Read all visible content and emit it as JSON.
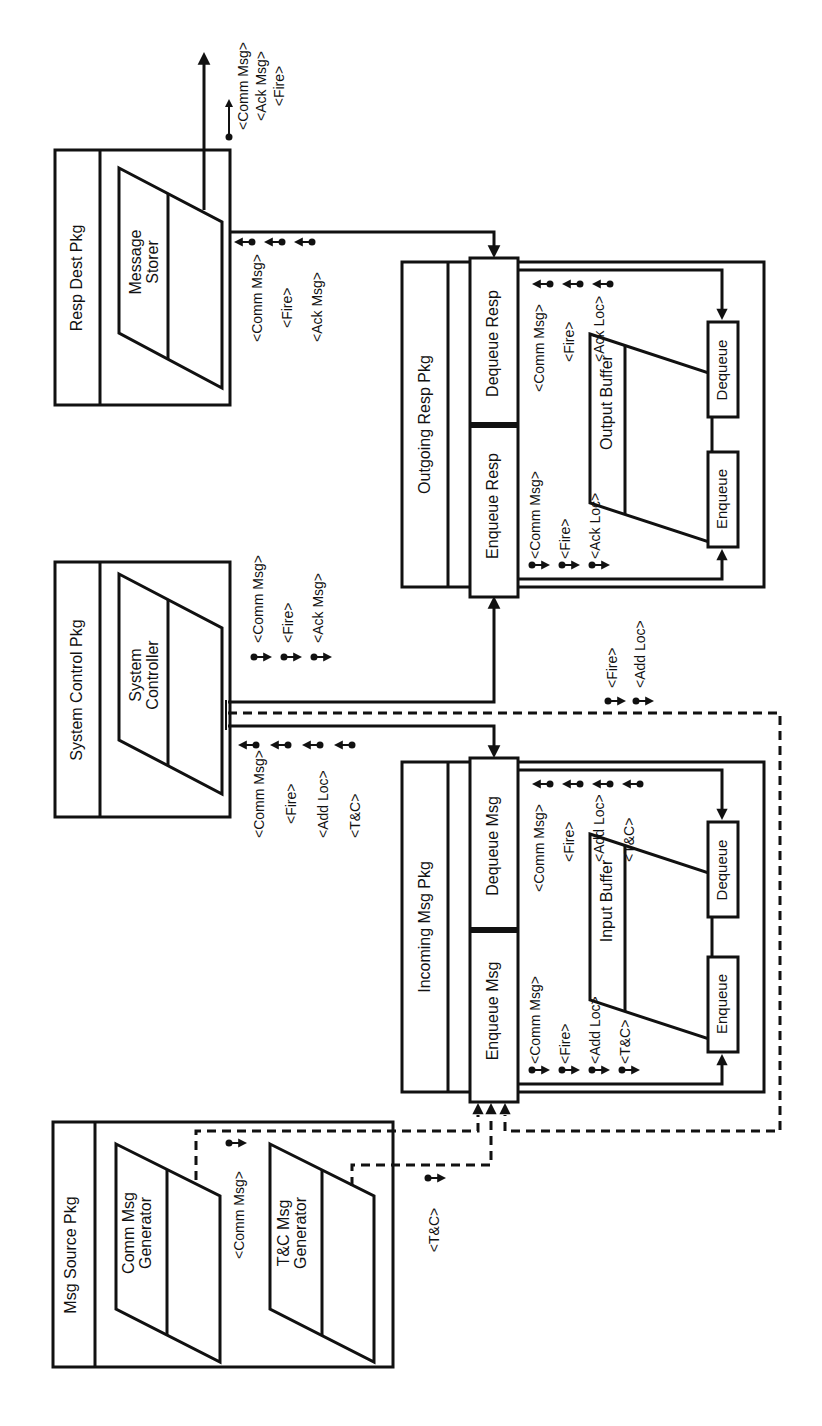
{
  "diagram": {
    "orientation": "rotated-90-ccw",
    "packages": {
      "resp_dest": {
        "title": "Resp Dest Pkg",
        "component": [
          "Message",
          "Storer"
        ]
      },
      "system_control": {
        "title": "System Control Pkg",
        "component": [
          "System",
          "Controller"
        ]
      },
      "msg_source": {
        "title": "Msg Source Pkg",
        "components": [
          [
            "Comm Msg",
            "Generator"
          ],
          [
            "T&C Msg",
            "Generator"
          ]
        ]
      },
      "outgoing_resp": {
        "title": "Outgoing Resp Pkg",
        "enqueue": "Enqueue Resp",
        "dequeue": "Dequeue Resp",
        "buffer": "Output Buffer",
        "buffer_enqueue": "Enqueue",
        "buffer_dequeue": "Dequeue"
      },
      "incoming_msg": {
        "title": "Incoming Msg Pkg",
        "enqueue": "Enqueue Msg",
        "dequeue": "Dequeue Msg",
        "buffer": "Input Buffer",
        "buffer_enqueue": "Enqueue",
        "buffer_dequeue": "Dequeue"
      }
    },
    "flows": {
      "resp_dest_out": [
        "<Comm Msg>",
        "<Ack Msg>",
        "<Fire>"
      ],
      "storer_in": [
        "<Comm Msg>",
        "<Fire>",
        "<Ack Msg>"
      ],
      "controller_to_outgoing": [
        "<Comm Msg>",
        "<Fire>",
        "<Ack Msg>"
      ],
      "incoming_to_controller": [
        "<Comm Msg>",
        "<Fire>",
        "<Add Loc>",
        "<T&C>"
      ],
      "controller_to_incoming_dashed": [
        "<Fire>",
        "<Add Loc>"
      ],
      "outgoing_enqueue": [
        "<Comm Msg>",
        "<Fire>",
        "<Ack Loc>"
      ],
      "outgoing_dequeue": [
        "<Comm Msg>",
        "<Fire>",
        "<Ack Loc>"
      ],
      "incoming_enqueue": [
        "<Comm Msg>",
        "<Fire>",
        "<Add Loc>",
        "<T&C>"
      ],
      "incoming_dequeue": [
        "<Comm Msg>",
        "<Fire>",
        "<Add Loc>",
        "<T&C>"
      ],
      "comm_generator_out": [
        "<Comm Msg>"
      ],
      "tc_generator_out": [
        "<T&C>"
      ]
    }
  }
}
